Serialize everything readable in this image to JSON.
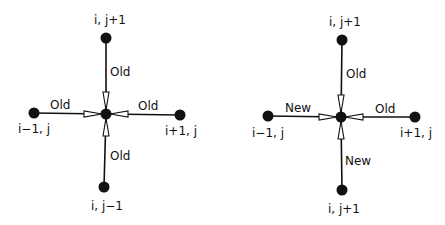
{
  "colors": {
    "line": "#111111",
    "background": "#ffffff"
  },
  "diagrams": [
    {
      "id": "left",
      "center": {
        "x": 106,
        "y": 114
      },
      "nodes": {
        "top": {
          "label": "i, j+1",
          "x": 106,
          "y": 38
        },
        "bottom": {
          "label": "i, j−1",
          "x": 104,
          "y": 187
        },
        "left": {
          "label": "i−1, j",
          "x": 34,
          "y": 113
        },
        "right": {
          "label": "i+1, j",
          "x": 180,
          "y": 115
        }
      },
      "edges": {
        "top": "Old",
        "bottom": "Old",
        "left": "Old",
        "right": "Old"
      }
    },
    {
      "id": "right",
      "center": {
        "x": 341,
        "y": 117
      },
      "nodes": {
        "top": {
          "label": "i, j+1",
          "x": 342,
          "y": 40
        },
        "bottom": {
          "label": "i, j+1",
          "x": 342,
          "y": 190
        },
        "left": {
          "label": "i−1, j",
          "x": 268,
          "y": 116
        },
        "right": {
          "label": "i+1, j",
          "x": 415,
          "y": 117
        }
      },
      "edges": {
        "top": "Old",
        "bottom": "New",
        "left": "New",
        "right": "Old"
      }
    }
  ]
}
